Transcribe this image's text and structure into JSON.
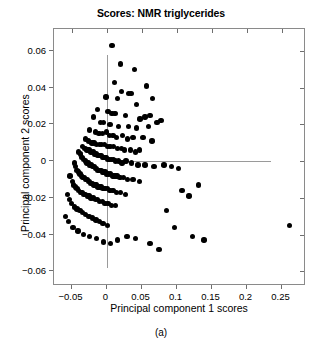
{
  "chart_data": {
    "type": "scatter",
    "title": "Scores: NMR triglycerides",
    "subcaption": "(a)",
    "xlabel": "Principal component 1 scores",
    "ylabel": "Principal component 2 scores",
    "xlim": [
      -0.075,
      0.285
    ],
    "ylim": [
      -0.068,
      0.072
    ],
    "xticks": [
      -0.05,
      0,
      0.05,
      0.1,
      0.15,
      0.2,
      0.25
    ],
    "xticklabels": [
      "-0.05",
      "0",
      "0.05",
      "0.1",
      "0.15",
      "0.2",
      "0.25"
    ],
    "yticks": [
      0.06,
      0.04,
      0.02,
      0,
      -0.02,
      -0.04,
      -0.06
    ],
    "yticklabels": [
      "0.06",
      "0.04",
      "0.02",
      "0",
      "-0.02",
      "-0.04",
      "-0.06"
    ],
    "grid": false,
    "legend": null,
    "marker": "filled-circle",
    "marker_color": "#000000",
    "marker_size_px": 5.4,
    "reference_lines": [
      {
        "orientation": "horizontal",
        "value": 0,
        "x_from": 0.0,
        "x_to": 0.235,
        "color": "#9a9a9a"
      },
      {
        "orientation": "vertical",
        "value": 0,
        "y_from": -0.058,
        "y_to": 0.058,
        "color": "#9a9a9a"
      }
    ],
    "series": [
      {
        "name": "samples",
        "n": 196,
        "points": [
          [
            0.008,
            0.063
          ],
          [
            0.02,
            0.053
          ],
          [
            0.04,
            0.05
          ],
          [
            0.011,
            0.043
          ],
          [
            0.057,
            0.041
          ],
          [
            0.021,
            0.038
          ],
          [
            0.031,
            0.037
          ],
          [
            0.035,
            0.037
          ],
          [
            -0.001,
            0.035
          ],
          [
            0.016,
            0.034
          ],
          [
            0.043,
            0.031
          ],
          [
            0.066,
            0.034
          ],
          [
            -0.013,
            0.028
          ],
          [
            0.002,
            0.027
          ],
          [
            0.008,
            0.026
          ],
          [
            0.012,
            0.026
          ],
          [
            0.027,
            0.025
          ],
          [
            0.048,
            0.023
          ],
          [
            0.055,
            0.024
          ],
          [
            0.062,
            0.025
          ],
          [
            -0.019,
            0.024
          ],
          [
            -0.009,
            0.021
          ],
          [
            -0.004,
            0.021
          ],
          [
            0.005,
            0.02
          ],
          [
            0.017,
            0.019
          ],
          [
            0.031,
            0.019
          ],
          [
            0.043,
            0.018
          ],
          [
            0.06,
            0.019
          ],
          [
            0.072,
            0.021
          ],
          [
            0.078,
            0.022
          ],
          [
            -0.024,
            0.017
          ],
          [
            -0.016,
            0.016
          ],
          [
            -0.011,
            0.015
          ],
          [
            -0.006,
            0.015
          ],
          [
            0.0,
            0.016
          ],
          [
            0.004,
            0.014
          ],
          [
            0.009,
            0.014
          ],
          [
            0.014,
            0.013
          ],
          [
            0.023,
            0.014
          ],
          [
            0.03,
            0.012
          ],
          [
            0.038,
            0.013
          ],
          [
            0.052,
            0.013
          ],
          [
            0.065,
            0.011
          ],
          [
            -0.03,
            0.012
          ],
          [
            -0.026,
            0.011
          ],
          [
            -0.021,
            0.01
          ],
          [
            -0.018,
            0.01
          ],
          [
            -0.014,
            0.009
          ],
          [
            -0.01,
            0.009
          ],
          [
            -0.007,
            0.009
          ],
          [
            -0.003,
            0.009
          ],
          [
            0.001,
            0.008
          ],
          [
            0.005,
            0.008
          ],
          [
            0.01,
            0.008
          ],
          [
            0.016,
            0.007
          ],
          [
            0.021,
            0.007
          ],
          [
            0.026,
            0.006
          ],
          [
            0.034,
            0.006
          ],
          [
            0.041,
            0.005
          ],
          [
            0.047,
            0.006
          ],
          [
            -0.034,
            0.008
          ],
          [
            -0.031,
            0.007
          ],
          [
            -0.028,
            0.006
          ],
          [
            -0.025,
            0.006
          ],
          [
            -0.022,
            0.005
          ],
          [
            -0.019,
            0.005
          ],
          [
            -0.017,
            0.004
          ],
          [
            -0.015,
            0.004
          ],
          [
            -0.013,
            0.003
          ],
          [
            -0.011,
            0.003
          ],
          [
            -0.008,
            0.003
          ],
          [
            -0.006,
            0.002
          ],
          [
            -0.004,
            0.002
          ],
          [
            -0.002,
            0.002
          ],
          [
            0.0,
            0.002
          ],
          [
            0.002,
            0.001
          ],
          [
            0.004,
            0.001
          ],
          [
            0.007,
            0.001
          ],
          [
            0.01,
            0.001
          ],
          [
            0.013,
            0.0
          ],
          [
            0.017,
            0.0
          ],
          [
            0.022,
            -0.001
          ],
          [
            0.028,
            0.0
          ],
          [
            0.036,
            -0.001
          ],
          [
            0.045,
            -0.002
          ],
          [
            0.055,
            -0.002
          ],
          [
            0.068,
            -0.003
          ],
          [
            0.082,
            -0.002
          ],
          [
            0.093,
            -0.003
          ],
          [
            0.103,
            -0.004
          ],
          [
            -0.04,
            0.005
          ],
          [
            -0.037,
            0.004
          ],
          [
            -0.035,
            0.002
          ],
          [
            -0.033,
            0.001
          ],
          [
            -0.03,
            0.0
          ],
          [
            -0.028,
            -0.001
          ],
          [
            -0.026,
            -0.001
          ],
          [
            -0.024,
            -0.002
          ],
          [
            -0.022,
            -0.002
          ],
          [
            -0.02,
            -0.003
          ],
          [
            -0.018,
            -0.003
          ],
          [
            -0.016,
            -0.004
          ],
          [
            -0.014,
            -0.004
          ],
          [
            -0.012,
            -0.005
          ],
          [
            -0.01,
            -0.005
          ],
          [
            -0.008,
            -0.005
          ],
          [
            -0.006,
            -0.006
          ],
          [
            -0.004,
            -0.006
          ],
          [
            -0.002,
            -0.006
          ],
          [
            0.0,
            -0.007
          ],
          [
            0.003,
            -0.007
          ],
          [
            0.006,
            -0.007
          ],
          [
            0.009,
            -0.008
          ],
          [
            0.012,
            -0.008
          ],
          [
            0.015,
            -0.008
          ],
          [
            0.019,
            -0.009
          ],
          [
            0.024,
            -0.009
          ],
          [
            0.03,
            -0.01
          ],
          [
            0.038,
            -0.01
          ],
          [
            0.047,
            -0.011
          ],
          [
            -0.046,
            -0.001
          ],
          [
            -0.044,
            -0.003
          ],
          [
            -0.042,
            -0.005
          ],
          [
            -0.04,
            -0.006
          ],
          [
            -0.038,
            -0.007
          ],
          [
            -0.036,
            -0.008
          ],
          [
            -0.034,
            -0.009
          ],
          [
            -0.032,
            -0.009
          ],
          [
            -0.03,
            -0.01
          ],
          [
            -0.028,
            -0.01
          ],
          [
            -0.026,
            -0.011
          ],
          [
            -0.024,
            -0.011
          ],
          [
            -0.022,
            -0.012
          ],
          [
            -0.02,
            -0.012
          ],
          [
            -0.018,
            -0.013
          ],
          [
            -0.016,
            -0.013
          ],
          [
            -0.014,
            -0.013
          ],
          [
            -0.012,
            -0.014
          ],
          [
            -0.01,
            -0.014
          ],
          [
            -0.008,
            -0.014
          ],
          [
            -0.005,
            -0.015
          ],
          [
            -0.002,
            -0.015
          ],
          [
            0.001,
            -0.015
          ],
          [
            0.005,
            -0.016
          ],
          [
            0.009,
            -0.016
          ],
          [
            0.014,
            -0.017
          ],
          [
            0.02,
            -0.017
          ],
          [
            0.027,
            -0.018
          ],
          [
            -0.052,
            -0.008
          ],
          [
            -0.049,
            -0.011
          ],
          [
            -0.047,
            -0.013
          ],
          [
            -0.044,
            -0.014
          ],
          [
            -0.042,
            -0.015
          ],
          [
            -0.04,
            -0.016
          ],
          [
            -0.037,
            -0.017
          ],
          [
            -0.035,
            -0.017
          ],
          [
            -0.032,
            -0.018
          ],
          [
            -0.03,
            -0.018
          ],
          [
            -0.027,
            -0.019
          ],
          [
            -0.025,
            -0.019
          ],
          [
            -0.022,
            -0.02
          ],
          [
            -0.019,
            -0.02
          ],
          [
            -0.016,
            -0.021
          ],
          [
            -0.013,
            -0.021
          ],
          [
            -0.01,
            -0.022
          ],
          [
            -0.006,
            -0.022
          ],
          [
            -0.002,
            -0.023
          ],
          [
            0.002,
            -0.023
          ],
          [
            0.007,
            -0.024
          ],
          [
            0.013,
            -0.024
          ],
          [
            -0.056,
            -0.018
          ],
          [
            -0.053,
            -0.021
          ],
          [
            -0.05,
            -0.023
          ],
          [
            -0.046,
            -0.025
          ],
          [
            -0.042,
            -0.026
          ],
          [
            -0.038,
            -0.027
          ],
          [
            -0.034,
            -0.028
          ],
          [
            -0.03,
            -0.029
          ],
          [
            -0.025,
            -0.03
          ],
          [
            -0.02,
            -0.031
          ],
          [
            -0.015,
            -0.032
          ],
          [
            -0.01,
            -0.033
          ],
          [
            -0.005,
            -0.034
          ],
          [
            0.001,
            -0.035
          ],
          [
            -0.059,
            -0.03
          ],
          [
            -0.054,
            -0.033
          ],
          [
            -0.048,
            -0.036
          ],
          [
            -0.041,
            -0.038
          ],
          [
            -0.033,
            -0.04
          ],
          [
            -0.024,
            -0.041
          ],
          [
            -0.014,
            -0.042
          ],
          [
            -0.004,
            -0.044
          ],
          [
            0.006,
            -0.045
          ],
          [
            0.016,
            -0.043
          ],
          [
            0.029,
            -0.041
          ],
          [
            0.041,
            -0.042
          ],
          [
            0.062,
            -0.045
          ],
          [
            0.075,
            -0.048
          ],
          [
            0.108,
            -0.016
          ],
          [
            0.118,
            -0.019
          ],
          [
            0.131,
            -0.013
          ],
          [
            0.123,
            -0.041
          ],
          [
            0.139,
            -0.043
          ],
          [
            0.086,
            -0.027
          ],
          [
            0.097,
            -0.036
          ],
          [
            0.261,
            -0.035
          ]
        ]
      }
    ]
  }
}
